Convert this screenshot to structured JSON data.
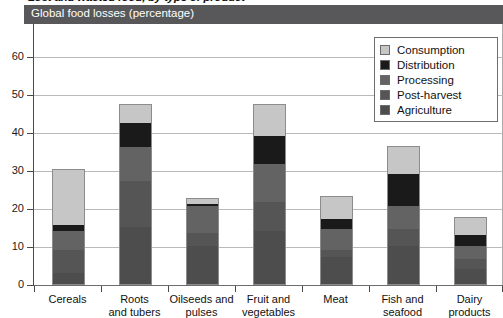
{
  "figure": {
    "super_title": "Lost and wasted food, by type of product",
    "panel_title": "Global food losses (percentage)"
  },
  "colors": {
    "consumption": "#c6c6c6",
    "distribution": "#1a1a1a",
    "processing": "#636363",
    "post_harvest": "#555555",
    "agriculture": "#4d4d4d",
    "header_band": "#58585a",
    "gridline": "#b9b9b9",
    "axis": "#4a4a4a"
  },
  "legend": {
    "items": [
      {
        "label": "Consumption",
        "color": "#c6c6c6"
      },
      {
        "label": "Distribution",
        "color": "#1a1a1a"
      },
      {
        "label": "Processing",
        "color": "#636363"
      },
      {
        "label": "Post-harvest",
        "color": "#555555"
      },
      {
        "label": "Agriculture",
        "color": "#4d4d4d"
      }
    ]
  },
  "chart_data": {
    "type": "bar",
    "stacked": true,
    "title": "Global food losses (percentage)",
    "xlabel": "",
    "ylabel": "",
    "ylim": [
      0,
      65
    ],
    "yticks": [
      0,
      10,
      20,
      30,
      40,
      50,
      60
    ],
    "ytick_labels": [
      "0",
      "10",
      "20",
      "30",
      "40",
      "50",
      "60"
    ],
    "grid": true,
    "legend_position": "top-right",
    "categories": [
      "Cereals",
      "Roots and tubers",
      "Oilseeds and pulses",
      "Fruit and vegetables",
      "Meat",
      "Fish and seafood",
      "Dairy products"
    ],
    "category_lines": [
      [
        "Cereals"
      ],
      [
        "Roots",
        "and tubers"
      ],
      [
        "Oilseeds and",
        "pulses"
      ],
      [
        "Fruit and",
        "vegetables"
      ],
      [
        "Meat"
      ],
      [
        "Fish and",
        "seafood"
      ],
      [
        "Dairy",
        "products"
      ]
    ],
    "series": [
      {
        "name": "Agriculture",
        "color": "#4d4d4d",
        "values": [
          3.0,
          15.0,
          10.0,
          14.0,
          7.0,
          10.0,
          4.0
        ]
      },
      {
        "name": "Post-harvest",
        "color": "#555555",
        "values": [
          6.0,
          12.0,
          3.5,
          7.5,
          2.0,
          4.5,
          2.5
        ]
      },
      {
        "name": "Processing",
        "color": "#636363",
        "values": [
          5.0,
          9.0,
          7.0,
          10.0,
          5.5,
          6.0,
          3.5
        ]
      },
      {
        "name": "Distribution",
        "color": "#1a1a1a",
        "values": [
          1.5,
          6.5,
          0.5,
          7.5,
          2.5,
          8.5,
          3.0
        ]
      },
      {
        "name": "Consumption",
        "color": "#c6c6c6",
        "values": [
          14.5,
          4.5,
          1.5,
          8.0,
          6.0,
          7.0,
          4.5
        ]
      }
    ],
    "totals": [
      30.0,
      47.0,
      22.5,
      47.0,
      23.0,
      36.0,
      17.5
    ]
  }
}
